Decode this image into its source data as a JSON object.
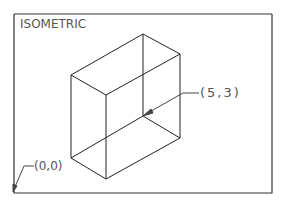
{
  "title": "ISOMETRIC",
  "labels": {
    "point_a": "(5,3)",
    "origin": "(0,0)"
  },
  "colors": {
    "line": "#222222",
    "text": "#555555",
    "frame": "#333333"
  }
}
